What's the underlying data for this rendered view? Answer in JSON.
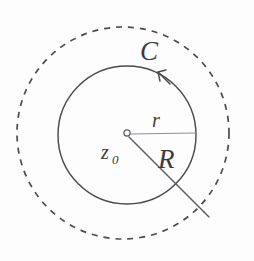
{
  "figure": {
    "background_color": "#fdfdfd",
    "ink_color": "#4a4a50",
    "width": 254,
    "height": 261,
    "labels": {
      "contour": "C",
      "inner_radius": "r",
      "outer_radius": "R",
      "center_base": "z",
      "center_subscript": "0",
      "center_full": "z0"
    },
    "elements": {
      "outer_boundary_style": "dashed",
      "contour_style": "solid",
      "contour_orientation": "counterclockwise",
      "arrow_icon": "arrowhead-icon",
      "center_point_icon": "center-dot-icon"
    },
    "geometry": {
      "center_x": 127,
      "center_y": 134,
      "contour_radius": 70,
      "outer_radius": 107,
      "r_line_end_x": 196,
      "r_line_end_y": 134,
      "R_line_end_x": 204,
      "R_line_end_y": 213
    }
  }
}
